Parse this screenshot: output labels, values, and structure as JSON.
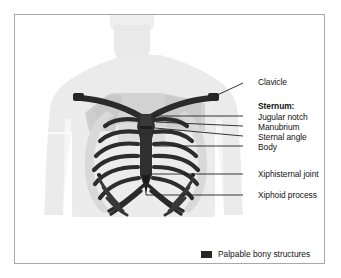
{
  "figure": {
    "background_color": "#ffffff",
    "frame_border_color": "#a8a8a8",
    "body_silhouette_color": "#ebebeb",
    "muscle_shading_color": "#c9c9c9",
    "bone_dark_color": "#2b2b2b",
    "bone_light_color": "#d8d8d8",
    "leader_line_color": "#1f1f1f"
  },
  "labels": {
    "clavicle": "Clavicle",
    "sternum_heading": "Sternum:",
    "jugular_notch": "Jugular notch",
    "manubrium": "Manubrium",
    "sternal_angle": "Sternal angle",
    "body": "Body",
    "xiphisternal_joint": "Xiphisternal joint",
    "xiphoid_process": "Xiphoid process"
  },
  "legend": {
    "swatch_color": "#262626",
    "text": "Palpable bony structures"
  }
}
